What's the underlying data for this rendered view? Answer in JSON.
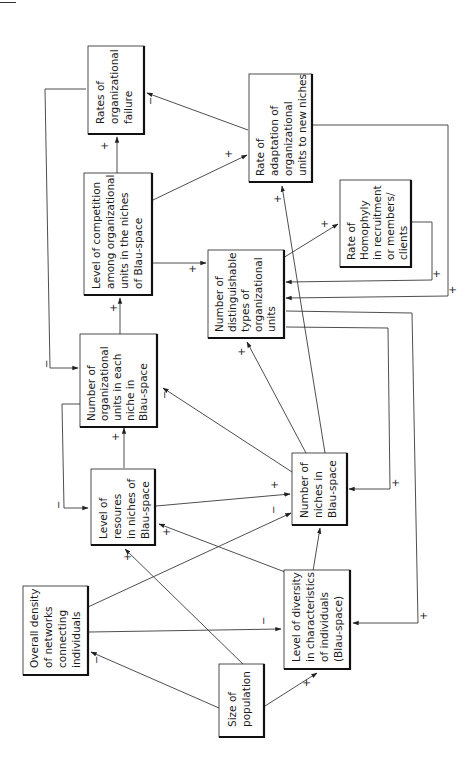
{
  "diagram": {
    "orientation": "rotated-90-ccw",
    "nodes": [
      {
        "id": "failure",
        "lines": [
          "Rates of",
          "organizational",
          "failure"
        ]
      },
      {
        "id": "adaptation",
        "lines": [
          "Rate of",
          "adaptation of",
          "organizational",
          "units to new niches"
        ]
      },
      {
        "id": "competition",
        "lines": [
          "Level of competition",
          "among organizational",
          "units in the niches",
          "of Blau-space"
        ]
      },
      {
        "id": "homophyly",
        "lines": [
          "Rate of",
          "Homophyly",
          "in recruitment",
          "or members/",
          "clients"
        ]
      },
      {
        "id": "types",
        "lines": [
          "Number of",
          "distinguishable",
          "types of",
          "organizational",
          "units"
        ]
      },
      {
        "id": "units_per_niche",
        "lines": [
          "Number of",
          "organizational",
          "units in each",
          "niche in",
          "Blau-space"
        ]
      },
      {
        "id": "resources",
        "lines": [
          "Level of",
          "resoures",
          "in niches of",
          "Blau-space"
        ]
      },
      {
        "id": "niches",
        "lines": [
          "Number of",
          "niches in",
          "Blau-space"
        ]
      },
      {
        "id": "density",
        "lines": [
          "Overall density",
          "of networks",
          "connecting",
          "individuals"
        ]
      },
      {
        "id": "diversity",
        "lines": [
          "Level of diversity",
          "in characteristics",
          "of individuals",
          "(Blau-space)"
        ]
      },
      {
        "id": "population",
        "lines": [
          "Size of",
          "population"
        ]
      }
    ],
    "edges": [
      {
        "from": "competition",
        "to": "failure",
        "sign": "+"
      },
      {
        "from": "adaptation",
        "to": "failure",
        "sign": "-"
      },
      {
        "from": "competition",
        "to": "adaptation",
        "sign": "+"
      },
      {
        "from": "units_per_niche",
        "to": "competition",
        "sign": "+"
      },
      {
        "from": "competition",
        "to": "types",
        "sign": "+"
      },
      {
        "from": "failure",
        "to": "units_per_niche",
        "sign": "-"
      },
      {
        "from": "types",
        "to": "homophyly",
        "sign": "+"
      },
      {
        "from": "homophyly",
        "to": "types",
        "sign": "+"
      },
      {
        "from": "adaptation",
        "to": "types",
        "sign": "+"
      },
      {
        "from": "niches",
        "to": "adaptation",
        "sign": "+"
      },
      {
        "from": "niches",
        "to": "types",
        "sign": "+"
      },
      {
        "from": "niches",
        "to": "units_per_niche",
        "sign": "-"
      },
      {
        "from": "resources",
        "to": "units_per_niche",
        "sign": "+"
      },
      {
        "from": "units_per_niche",
        "to": "resources",
        "sign": "-"
      },
      {
        "from": "resources",
        "to": "niches",
        "sign": "+"
      },
      {
        "from": "density",
        "to": "niches",
        "sign": "-"
      },
      {
        "from": "types",
        "to": "niches",
        "sign": "+"
      },
      {
        "from": "types",
        "to": "diversity",
        "sign": "+"
      },
      {
        "from": "diversity",
        "to": "niches",
        "sign": "+"
      },
      {
        "from": "diversity",
        "to": "resources",
        "sign": "+"
      },
      {
        "from": "population",
        "to": "resources",
        "sign": "+"
      },
      {
        "from": "density",
        "to": "diversity",
        "sign": "-"
      },
      {
        "from": "population",
        "to": "density",
        "sign": "-"
      },
      {
        "from": "population",
        "to": "diversity",
        "sign": "+"
      }
    ]
  }
}
